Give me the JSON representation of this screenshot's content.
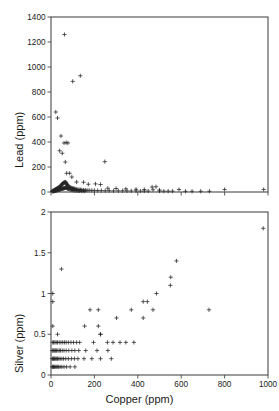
{
  "figure": {
    "width": 279,
    "height": 411,
    "background": "#ffffff",
    "marker_color": "#262626",
    "axis_color": "#4a4a4a",
    "marker_symbol": "plus"
  },
  "chart_data": [
    {
      "type": "scatter",
      "panel": "top",
      "title": "",
      "xlabel": "",
      "ylabel": "Lead (ppm)",
      "xlim": [
        0,
        1000
      ],
      "ylim": [
        0,
        1400
      ],
      "xticks": [
        0,
        200,
        400,
        600,
        800,
        1000
      ],
      "xticklabels": [
        "",
        "",
        "",
        "",
        "",
        ""
      ],
      "yticks": [
        0,
        200,
        400,
        600,
        800,
        1000,
        1200,
        1400
      ],
      "yticklabels": [
        "0",
        "200",
        "400",
        "600",
        "800",
        "1000",
        "1200",
        "1400"
      ],
      "grid": false,
      "legend": null,
      "x": [
        62,
        100,
        135,
        22,
        30,
        46,
        60,
        70,
        78,
        40,
        52,
        66,
        72,
        86,
        96,
        118,
        150,
        248,
        5,
        9,
        12,
        14,
        16,
        18,
        20,
        22,
        24,
        26,
        28,
        30,
        32,
        34,
        36,
        38,
        40,
        42,
        44,
        46,
        48,
        50,
        52,
        54,
        56,
        58,
        60,
        62,
        64,
        66,
        68,
        70,
        72,
        74,
        76,
        78,
        80,
        84,
        88,
        92,
        96,
        100,
        104,
        108,
        112,
        118,
        124,
        130,
        136,
        142,
        150,
        158,
        166,
        176,
        188,
        200,
        215,
        232,
        250,
        268,
        288,
        310,
        330,
        350,
        370,
        392,
        412,
        430,
        448,
        466,
        484,
        500,
        520,
        540,
        560,
        590,
        620,
        650,
        690,
        730,
        800,
        980,
        172,
        205,
        228,
        262,
        300,
        345,
        392,
        430,
        470,
        500,
        8,
        10,
        13,
        15,
        17,
        19,
        21,
        23,
        25,
        27,
        29,
        31,
        33,
        35,
        37,
        39,
        41,
        43,
        45,
        47,
        49,
        51,
        53,
        55,
        57,
        59,
        61,
        63,
        65,
        67,
        69,
        71,
        73,
        75,
        77,
        79,
        82,
        86,
        90,
        94,
        98,
        102,
        106,
        110,
        115,
        120,
        126,
        132,
        140,
        148,
        156
      ],
      "y": [
        1260,
        885,
        930,
        640,
        592,
        448,
        392,
        395,
        392,
        330,
        310,
        240,
        150,
        150,
        120,
        80,
        78,
        243,
        8,
        10,
        12,
        14,
        15,
        18,
        20,
        22,
        24,
        26,
        28,
        30,
        32,
        34,
        36,
        38,
        40,
        44,
        48,
        52,
        56,
        60,
        64,
        68,
        70,
        72,
        74,
        76,
        78,
        80,
        78,
        72,
        66,
        60,
        55,
        50,
        46,
        42,
        38,
        34,
        32,
        30,
        28,
        26,
        24,
        22,
        20,
        19,
        18,
        17,
        16,
        15,
        14,
        14,
        13,
        13,
        12,
        12,
        11,
        11,
        10,
        10,
        10,
        9,
        9,
        9,
        8,
        8,
        8,
        40,
        42,
        8,
        7,
        7,
        7,
        20,
        6,
        6,
        6,
        6,
        20,
        20,
        62,
        65,
        60,
        30,
        28,
        25,
        22,
        20,
        18,
        16,
        5,
        6,
        7,
        8,
        9,
        10,
        11,
        12,
        13,
        14,
        15,
        16,
        17,
        18,
        19,
        20,
        21,
        22,
        23,
        24,
        25,
        26,
        27,
        28,
        29,
        30,
        31,
        32,
        33,
        34,
        35,
        34,
        32,
        30,
        28,
        26,
        24,
        22,
        20,
        18,
        16,
        15,
        14,
        13,
        12,
        11,
        10,
        9,
        8,
        8,
        7,
        7
      ]
    },
    {
      "type": "scatter",
      "panel": "bottom",
      "title": "",
      "xlabel": "Copper (ppm)",
      "ylabel": "Silver (ppm)",
      "xlim": [
        0,
        1000
      ],
      "ylim": [
        0,
        2
      ],
      "xticks": [
        0,
        200,
        400,
        600,
        800,
        1000
      ],
      "xticklabels": [
        "0",
        "200",
        "400",
        "600",
        "800",
        "1000"
      ],
      "yticks": [
        0,
        0.5,
        1,
        1.5,
        2
      ],
      "yticklabels": [
        "0",
        "0.5",
        "1",
        "1.5",
        "2"
      ],
      "grid": false,
      "legend": null,
      "x": [
        978,
        578,
        552,
        550,
        48,
        8,
        8,
        486,
        444,
        470,
        425,
        180,
        218,
        228,
        728,
        370,
        302,
        425,
        155,
        218,
        8,
        30,
        228,
        8,
        12,
        18,
        24,
        30,
        38,
        46,
        54,
        62,
        70,
        80,
        92,
        104,
        118,
        132,
        196,
        260,
        286,
        318,
        345,
        382,
        6,
        10,
        14,
        18,
        22,
        26,
        32,
        38,
        44,
        52,
        60,
        70,
        82,
        96,
        110,
        128,
        160,
        212,
        262,
        6,
        9,
        12,
        16,
        20,
        25,
        30,
        36,
        42,
        50,
        58,
        68,
        80,
        94,
        108,
        124,
        152,
        188,
        228,
        278,
        6,
        9,
        12,
        15,
        19,
        24,
        29,
        35,
        42,
        50,
        60,
        72,
        88,
        110
      ],
      "y": [
        1.8,
        1.4,
        1.2,
        1.1,
        1.3,
        1.0,
        0.9,
        1.0,
        0.9,
        0.8,
        0.7,
        0.8,
        0.8,
        0.5,
        0.8,
        0.8,
        0.7,
        0.9,
        0.6,
        0.6,
        0.6,
        0.5,
        0.5,
        0.4,
        0.4,
        0.4,
        0.4,
        0.4,
        0.4,
        0.4,
        0.4,
        0.4,
        0.4,
        0.4,
        0.4,
        0.4,
        0.4,
        0.4,
        0.4,
        0.4,
        0.4,
        0.4,
        0.4,
        0.4,
        0.3,
        0.3,
        0.3,
        0.3,
        0.3,
        0.3,
        0.3,
        0.3,
        0.3,
        0.3,
        0.3,
        0.3,
        0.3,
        0.3,
        0.3,
        0.3,
        0.3,
        0.3,
        0.3,
        0.2,
        0.2,
        0.2,
        0.2,
        0.2,
        0.2,
        0.2,
        0.2,
        0.2,
        0.2,
        0.2,
        0.2,
        0.2,
        0.2,
        0.2,
        0.2,
        0.2,
        0.2,
        0.2,
        0.2,
        0.1,
        0.1,
        0.1,
        0.1,
        0.1,
        0.1,
        0.1,
        0.1,
        0.1,
        0.1,
        0.1,
        0.1,
        0.1,
        0.1
      ]
    }
  ]
}
